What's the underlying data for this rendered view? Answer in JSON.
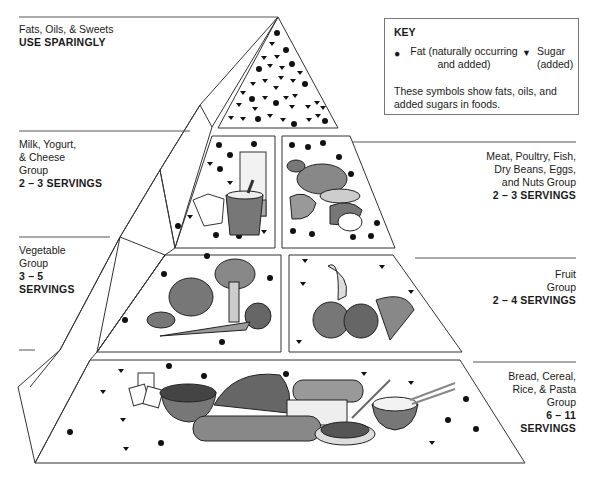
{
  "key": {
    "title": "KEY",
    "fat_symbol": "●",
    "fat_label_line1": "Fat (naturally occurring",
    "fat_label_line2": "and added)",
    "sugar_symbol": "▼",
    "sugar_label_line1": "Sugar",
    "sugar_label_line2": "(added)",
    "note_line1": "These symbols show fats, oils, and",
    "note_line2": "added sugars in foods."
  },
  "groups": [
    {
      "id": "fats",
      "lines": [
        "Fats, Oils, & Sweets"
      ],
      "servings": "USE SPARINGLY",
      "side": "left"
    },
    {
      "id": "milk",
      "lines": [
        "Milk, Yogurt,",
        "& Cheese",
        "Group"
      ],
      "servings": "2 – 3 SERVINGS",
      "side": "left"
    },
    {
      "id": "meat",
      "lines": [
        "Meat, Poultry, Fish,",
        "Dry Beans, Eggs,",
        "and Nuts Group"
      ],
      "servings": "2 – 3 SERVINGS",
      "side": "right"
    },
    {
      "id": "vegetable",
      "lines": [
        "Vegetable",
        "Group"
      ],
      "servings": "3 – 5",
      "servings2": "SERVINGS",
      "side": "left"
    },
    {
      "id": "fruit",
      "lines": [
        "Fruit",
        "Group"
      ],
      "servings": "2 – 4 SERVINGS",
      "side": "right"
    },
    {
      "id": "bread",
      "lines": [
        "Bread, Cereal,",
        "Rice, & Pasta",
        "Group"
      ],
      "servings": "6 – 11",
      "servings2": "SERVINGS",
      "side": "right"
    }
  ],
  "food_illustrations": {
    "milk": [
      "glass of milk",
      "yogurt cup",
      "cheese"
    ],
    "meat": [
      "chicken",
      "fish",
      "steak",
      "egg",
      "beans",
      "nuts"
    ],
    "vegetable": [
      "lettuce",
      "broccoli",
      "potato",
      "carrot",
      "tomato"
    ],
    "fruit": [
      "banana",
      "orange",
      "apple",
      "grapes"
    ],
    "bread": [
      "crackers",
      "cereal bowl",
      "bread loaf",
      "baguette",
      "sliced bread",
      "spaghetti",
      "rice bowl"
    ]
  },
  "colors": {
    "line": "#333333",
    "symbol": "#111111",
    "food_fill": "#7a7a7a"
  }
}
